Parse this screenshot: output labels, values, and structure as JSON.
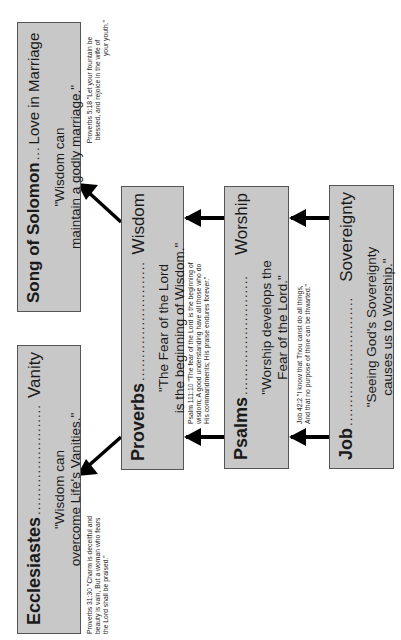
{
  "diagram": {
    "boxes": {
      "song": {
        "book": "Song of Solomon",
        "dots": "...",
        "theme": "Love in Marriage",
        "quote_line1": "\"Wisdom can",
        "quote_line2": "maintain a godly marriage.\""
      },
      "ecclesiastes": {
        "book": "Ecclesiastes",
        "dots": "........................",
        "theme": "Vanity",
        "quote_line1": "\"Wisdom can",
        "quote_line2": "overcome Life's Vanities.\""
      },
      "proverbs": {
        "book": "Proverbs",
        "dots": "..........................",
        "theme": "Wisdom",
        "quote_line1": "\"The Fear of the Lord",
        "quote_line2": "is the beginning of Wisdom.\""
      },
      "psalms": {
        "book": "Psalms",
        "dots": "..........................",
        "theme": "Worship",
        "quote_line1": "\"Worship develops the",
        "quote_line2": "Fear of the Lord.\""
      },
      "job": {
        "book": "Job",
        "dots": "............................",
        "theme": "Sovereignty",
        "quote_line1": "\"Seeing God's Sovereignty",
        "quote_line2": "causes us to Worship.\""
      }
    },
    "verses": {
      "song": {
        "line1": "Proverbs 5:18 \"Let your fountain be",
        "line2": "blessed, and rejoice in the wife of",
        "line3": "your youth.\""
      },
      "ecclesiastes": {
        "line1": "Proverbs 31:30 \"Charm is deceitful and",
        "line2": "beauty is vain, But a woman who fears",
        "line3": "the Lord shall be praised.\""
      },
      "proverbs": {
        "line1": "Psalm 111:10 \"The fear of the Lord is the beginning of",
        "line2": "wisdom; A good understanding have all those who do",
        "line3": "His commandments; His praise endures forever.\""
      },
      "psalms": {
        "line1": "Job 42:2 \"I know that Thou canst do all things,",
        "line2": "And that no purpose of thine can be thwarted.\""
      }
    },
    "colors": {
      "box_fill": "#c8c8c8",
      "box_border": "#555555",
      "arrow": "#000000"
    }
  }
}
